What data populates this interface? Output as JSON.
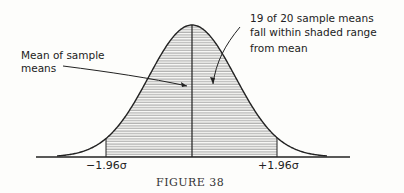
{
  "figure": {
    "caption": "FIGURE 38",
    "annotations": {
      "mean_label_line1": "Mean of sample",
      "mean_label_line2": "means",
      "range_label_line1": "19 of 20 sample means",
      "range_label_line2": "fall within shaded range",
      "range_label_line3": "from mean"
    },
    "axis_labels": {
      "left": "−1.96σ",
      "right": "+1.96σ"
    },
    "colors": {
      "ink": "#222222",
      "hatch": "#555555",
      "background": "#fdfdfb"
    }
  },
  "chart_data": {
    "type": "area",
    "distribution": "normal",
    "shaded_interval": [
      -1.96,
      1.96
    ],
    "shaded_probability": 0.95,
    "center_line": 0,
    "tick_labels": [
      "−1.96σ",
      "+1.96σ"
    ],
    "annotations": [
      "Mean of sample means",
      "19 of 20 sample means fall within shaded range from mean"
    ],
    "caption": "FIGURE 38"
  }
}
